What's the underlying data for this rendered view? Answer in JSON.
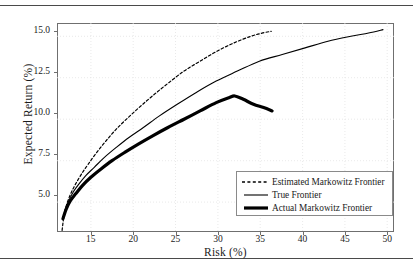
{
  "chart_data": {
    "type": "line",
    "title": "",
    "xlabel": "Risk (%)",
    "ylabel": "Expected Return (%)",
    "xlim": [
      11.0,
      50.8
    ],
    "ylim": [
      3.2,
      15.8
    ],
    "xticks": [
      15,
      20,
      25,
      30,
      35,
      40,
      45,
      50
    ],
    "yticks": [
      "5.0",
      "7.5",
      "10.0",
      "12.5",
      "15.0"
    ],
    "xtick_labels": [
      "15",
      "20",
      "25",
      "30",
      "35",
      "40",
      "45",
      "50"
    ],
    "grid": true,
    "legend_position": "lower right",
    "series": [
      {
        "name": "Estimated Markowitz Frontier",
        "style": "dashed",
        "width": 1.2,
        "color": "#000000",
        "points": [
          [
            11.6,
            3.3
          ],
          [
            11.8,
            4.1
          ],
          [
            12.0,
            4.6
          ],
          [
            12.3,
            5.1
          ],
          [
            12.7,
            5.6
          ],
          [
            13.2,
            6.1
          ],
          [
            13.9,
            6.7
          ],
          [
            14.7,
            7.3
          ],
          [
            15.7,
            8.0
          ],
          [
            16.8,
            8.7
          ],
          [
            18.0,
            9.4
          ],
          [
            19.4,
            10.1
          ],
          [
            20.9,
            10.8
          ],
          [
            22.5,
            11.5
          ],
          [
            24.2,
            12.2
          ],
          [
            26.0,
            12.9
          ],
          [
            27.9,
            13.5
          ],
          [
            29.9,
            14.1
          ],
          [
            31.9,
            14.6
          ],
          [
            33.9,
            15.0
          ],
          [
            35.3,
            15.2
          ],
          [
            36.3,
            15.3
          ]
        ]
      },
      {
        "name": "True Frontier",
        "style": "solid",
        "width": 1.1,
        "color": "#000000",
        "points": [
          [
            11.7,
            4.0
          ],
          [
            12.0,
            4.6
          ],
          [
            12.4,
            5.1
          ],
          [
            12.9,
            5.6
          ],
          [
            13.6,
            6.1
          ],
          [
            14.4,
            6.6
          ],
          [
            15.4,
            7.1
          ],
          [
            16.6,
            7.7
          ],
          [
            18.0,
            8.3
          ],
          [
            19.5,
            8.9
          ],
          [
            21.2,
            9.5
          ],
          [
            23.1,
            10.2
          ],
          [
            25.2,
            10.9
          ],
          [
            27.4,
            11.6
          ],
          [
            29.8,
            12.3
          ],
          [
            32.3,
            12.9
          ],
          [
            34.9,
            13.5
          ],
          [
            37.6,
            13.9
          ],
          [
            40.3,
            14.3
          ],
          [
            43.0,
            14.7
          ],
          [
            45.7,
            15.0
          ],
          [
            47.8,
            15.2
          ],
          [
            49.5,
            15.4
          ]
        ]
      },
      {
        "name": "Actual Markowitz Frontier",
        "style": "solid-thick",
        "width": 3.2,
        "color": "#000000",
        "points": [
          [
            11.7,
            4.0
          ],
          [
            12.1,
            4.6
          ],
          [
            12.6,
            5.1
          ],
          [
            13.2,
            5.5
          ],
          [
            14.0,
            6.0
          ],
          [
            15.0,
            6.5
          ],
          [
            16.2,
            7.0
          ],
          [
            17.5,
            7.5
          ],
          [
            19.0,
            8.0
          ],
          [
            20.6,
            8.5
          ],
          [
            22.3,
            9.0
          ],
          [
            24.1,
            9.5
          ],
          [
            26.0,
            10.0
          ],
          [
            27.9,
            10.5
          ],
          [
            29.8,
            11.0
          ],
          [
            31.3,
            11.3
          ],
          [
            32.0,
            11.4
          ],
          [
            33.0,
            11.2
          ],
          [
            34.2,
            10.9
          ],
          [
            35.4,
            10.7
          ],
          [
            36.4,
            10.5
          ]
        ]
      }
    ],
    "legend_entries": [
      {
        "label": "Estimated Markowitz Frontier",
        "style": "dashed"
      },
      {
        "label": "True Frontier",
        "style": "solid"
      },
      {
        "label": "Actual Markowitz Frontier",
        "style": "solid-thick"
      }
    ]
  }
}
